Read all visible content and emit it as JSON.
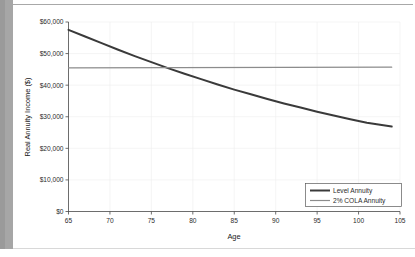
{
  "chart_data": {
    "type": "line",
    "title": "",
    "xlabel": "Age",
    "ylabel": "Real Annuity Income ($)",
    "xlim": [
      65,
      105
    ],
    "ylim": [
      0,
      60000
    ],
    "xticks": [
      65,
      70,
      75,
      80,
      85,
      90,
      95,
      100,
      105
    ],
    "xtick_labels": [
      "65",
      "70",
      "75",
      "80",
      "85",
      "90",
      "95",
      "100",
      "105"
    ],
    "yticks": [
      0,
      10000,
      20000,
      30000,
      40000,
      50000,
      60000
    ],
    "ytick_labels": [
      "$0",
      "$10,000",
      "$20,000",
      "$30,000",
      "$40,000",
      "$50,000",
      "$60,000"
    ],
    "grid": true,
    "legend_position": "lower right",
    "series": [
      {
        "name": "Level Annuity",
        "color": "#3a3a3a",
        "width": 2.0,
        "x": [
          65,
          67,
          69,
          71,
          73,
          75,
          77,
          79,
          81,
          83,
          85,
          87,
          89,
          91,
          93,
          95,
          97,
          99,
          101,
          104
        ],
        "values": [
          57500,
          55400,
          53300,
          51200,
          49200,
          47300,
          45400,
          43600,
          41900,
          40200,
          38600,
          37100,
          35600,
          34200,
          32900,
          31600,
          30400,
          29200,
          28100,
          26900
        ]
      },
      {
        "name": "2% COLA Annuity",
        "color": "#8c8c8c",
        "width": 1.2,
        "x": [
          65,
          104
        ],
        "values": [
          45500,
          45700
        ]
      }
    ],
    "annotations": {
      "crossover_age": 77,
      "crossover_value": 45400
    }
  },
  "legend": {
    "items": [
      {
        "label": "Level Annuity"
      },
      {
        "label": "2% COLA Annuity"
      }
    ]
  }
}
